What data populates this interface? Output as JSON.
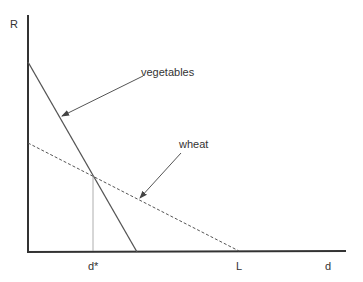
{
  "diagram": {
    "y_axis_label": "R",
    "x_axis_label": "d",
    "curves": [
      {
        "name": "vegetables",
        "label": "vegetables",
        "style": "solid"
      },
      {
        "name": "wheat",
        "label": "wheat",
        "style": "dashed"
      }
    ],
    "tick_labels": {
      "d_star": "d*",
      "L": "L"
    }
  }
}
